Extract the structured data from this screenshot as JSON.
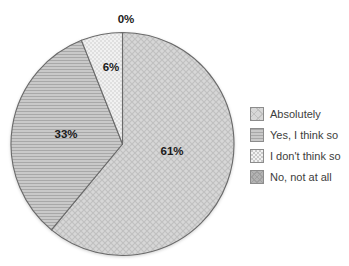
{
  "chart_data": {
    "type": "pie",
    "title": "",
    "categories": [
      "Absolutely",
      "Yes, I think so",
      "I don't think so",
      "No, not at all"
    ],
    "values": [
      61,
      33,
      6,
      0
    ],
    "data_labels": [
      "61%",
      "33%",
      "6%",
      "0%"
    ],
    "patterns": [
      "crosshatch",
      "hlines",
      "dots",
      "darkhatch"
    ],
    "start_angle_deg": 0,
    "direction": "clockwise",
    "legend_position": "right",
    "label_positions": [
      [
        172,
        151
      ],
      [
        66,
        134
      ],
      [
        111,
        67
      ],
      [
        126,
        19
      ]
    ],
    "geometry": {
      "cx": 122.5,
      "cy": 144,
      "r": 111.5
    },
    "colors": {
      "slice_outline": "#6a6a6a",
      "label_text": "#1a1a1a",
      "legend_text": "#3d3d3d",
      "crosshatch_base": "#d7d7d7",
      "crosshatch_line": "#c0c0c0",
      "hlines_base": "#c9c9c9",
      "hlines_line": "#a8a8a8",
      "dots_base": "#f1f1f1",
      "dots_dot": "#c9c9c9",
      "darkhatch_base": "#b3b3b3",
      "darkhatch_line": "#a0a0a0",
      "background": "#ffffff"
    }
  },
  "legend": {
    "items": [
      {
        "label": "Absolutely",
        "pattern": "crosshatch"
      },
      {
        "label": "Yes, I think so",
        "pattern": "hlines"
      },
      {
        "label": "I don't think so",
        "pattern": "dots"
      },
      {
        "label": "No, not at all",
        "pattern": "darkhatch"
      }
    ]
  }
}
